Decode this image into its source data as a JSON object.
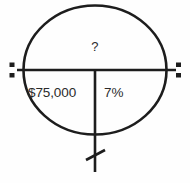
{
  "diagram": {
    "stroke_color": "#1d1d1d",
    "text_color": "#2b2b2b",
    "background_color": "#fefefe",
    "circle": {
      "center_x": 95,
      "center_y": 70,
      "radius_x": 72,
      "radius_y": 66
    },
    "labels": {
      "unknown": "?",
      "amount": "$75,000",
      "rate": "7%"
    },
    "markers": {
      "left_name": "division-colon-left",
      "right_name": "division-colon-right",
      "tail_name": "slashed-tail"
    }
  }
}
